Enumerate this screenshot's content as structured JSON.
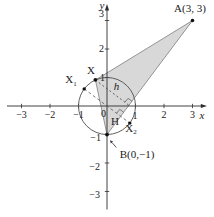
{
  "figure": {
    "axis": {
      "x_label": "x",
      "y_label": "y"
    },
    "x_tick_labels": [
      "−3",
      "−2",
      "−1",
      "0",
      "1",
      "2",
      "3"
    ],
    "y_tick_labels": [
      "3",
      "2",
      "1",
      "−1",
      "−2",
      "−3"
    ],
    "points": {
      "A": {
        "label": "A(3, 3)",
        "x": 3,
        "y": 3
      },
      "B": {
        "label": "B(0,−1)",
        "x": 0,
        "y": -1
      },
      "X": {
        "label": "X"
      },
      "X1": {
        "base": "X",
        "sub": "1"
      },
      "X2": {
        "base": "X",
        "sub": "2"
      },
      "H": {
        "label": "H"
      }
    },
    "height_label": "h",
    "shapes": {
      "circle": {
        "center_x": 0,
        "center_y": 0,
        "radius": 1
      },
      "triangle_vertices": [
        "X",
        "A",
        "B"
      ]
    },
    "colors": {
      "triangle_fill": "#d8d8d8",
      "triangle_edge": "#7d7d7d",
      "circle_stroke": "#4f4f4f",
      "axis": "#2e2e2e",
      "dashed": "#5a5a5a",
      "text": "#222222",
      "dot": "#111111",
      "background": "#ffffff"
    }
  }
}
